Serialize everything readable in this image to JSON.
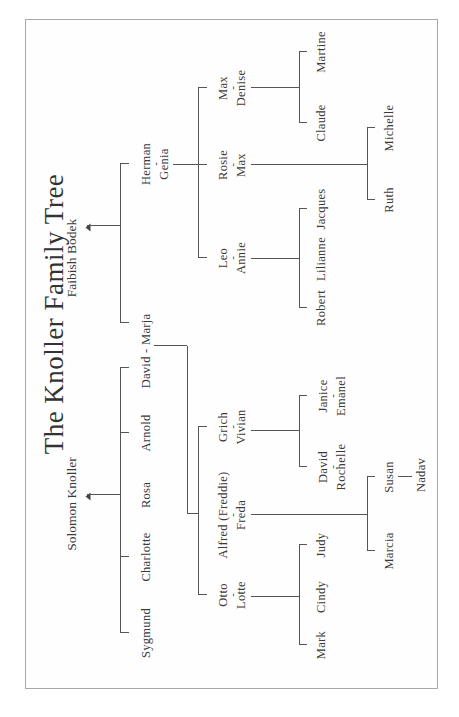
{
  "title": "The Knoller Family Tree",
  "roots": {
    "solomon": "Solomon Knoller",
    "faibish": "Faibish Bodek"
  },
  "solomon_children": [
    "Sygmund",
    "Charlotte",
    "Rosa",
    "Arnold",
    "David - Marja"
  ],
  "faibish_children": {
    "herman": "Herman",
    "genia": "Genia",
    "marja_link": "David - Marja"
  },
  "david_marja_children": [
    {
      "name": "Otto",
      "spouse": "Lotte",
      "children": [
        "Mark",
        "Cindy",
        "Judy"
      ]
    },
    {
      "name": "Alfred (Freddie)",
      "spouse": "Freda",
      "children": [
        "Marcia",
        "Susan"
      ],
      "grandchildren": {
        "Susan": [
          "Nadav"
        ]
      }
    },
    {
      "name": "Grich",
      "spouse": "Vivian",
      "children": [
        {
          "name": "David",
          "spouse": "Rochelle"
        },
        {
          "name": "Janice",
          "spouse": "Emanel"
        }
      ]
    }
  ],
  "herman_genia_children": [
    {
      "name": "Leo",
      "spouse": "Annie",
      "children": [
        "Robert",
        "Lilianne",
        "Jacques"
      ]
    },
    {
      "name": "Rosie",
      "spouse": "Max",
      "children": [
        "Ruth",
        "Michelle"
      ]
    },
    {
      "name": "Max",
      "spouse": "Denise",
      "children": [
        "Claude",
        "Martine"
      ]
    }
  ],
  "dash": "-",
  "colors": {
    "line": "#555555",
    "text": "#3a3a3a",
    "frame": "#a8a8a8"
  }
}
